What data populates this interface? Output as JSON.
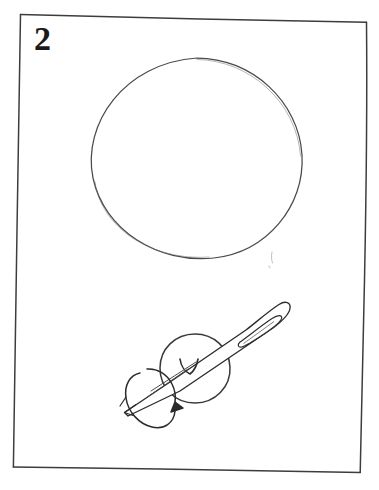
{
  "figure": {
    "kind": "hand-drawn-instructional-illustration",
    "medium": "pencil-line-drawing-on-white-paper",
    "step_number": "2",
    "caption": "",
    "panel": {
      "name": "hand-drawn-rectangular-frame",
      "stroke_color": "#3a3a3a",
      "fill_color": "#ffffff",
      "corners": [
        {
          "x": 20,
          "y": 14
        },
        {
          "x": 367,
          "y": 22
        },
        {
          "x": 360,
          "y": 473
        },
        {
          "x": 13,
          "y": 467
        }
      ]
    },
    "background_color": "#ffffff",
    "ink_color": "#2b2b2b",
    "elements": [
      {
        "name": "large-circle",
        "description": "Large hand-drawn circle occupying the upper half of the panel",
        "center_x": 197,
        "center_y": 160,
        "radius": 105,
        "stroke_color": "#4a4a4a",
        "stroke_width": 1.2,
        "fill": "none"
      },
      {
        "name": "ball-circle",
        "description": "Small circle (ball or cork) pierced by the needle in the lower half",
        "center_x": 195,
        "center_y": 369,
        "radius": 35,
        "stroke_color": "#3a3a3a",
        "stroke_width": 1.4,
        "fill": "none"
      },
      {
        "name": "needle",
        "description": "Sewing needle passing diagonally through the small circle, eye at upper right, point at lower left",
        "tip_x": 124,
        "tip_y": 412,
        "butt_x": 289,
        "butt_y": 304,
        "stroke_color": "#2b2b2b",
        "stroke_width": 1.3
      },
      {
        "name": "needle-eye",
        "description": "Elongated oval eye slot near the blunt upper-right end of the needle",
        "center_x": 258,
        "center_y": 326,
        "length": 46,
        "width": 11,
        "angle_deg": -33
      },
      {
        "name": "rotation-arrow",
        "description": "Curved ellipse arrow wrapped around the needle shaft indicating spin/rotation direction",
        "center_x": 152,
        "center_y": 395,
        "rx": 17,
        "ry": 31,
        "angle_deg": -28,
        "arrowhead_x": 176,
        "arrowhead_y": 402,
        "direction": "counterclockwise-about-needle-axis"
      },
      {
        "name": "entry-mark",
        "description": "Small V-shaped pencil mark where the needle enters the ball",
        "x": 186,
        "y": 363
      },
      {
        "name": "shaft-highlight-lines",
        "description": "Two short parallel pencil strokes below the needle shaft suggesting its rounded body",
        "x": 163,
        "y": 381
      },
      {
        "name": "stray-pencil-mark",
        "description": "Faint stray pencil tick below the right side of the large circle",
        "x": 272,
        "y": 258
      }
    ]
  }
}
